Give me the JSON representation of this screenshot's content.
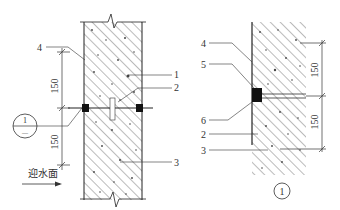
{
  "diagram": {
    "type": "construction detail – waterproof construction joint",
    "left_view": {
      "callouts": [
        {
          "id": "4",
          "label": "4"
        },
        {
          "id": "1",
          "label": "1"
        },
        {
          "id": "2",
          "label": "2"
        },
        {
          "id": "3",
          "label": "3"
        }
      ],
      "dimensions": [
        "150",
        "150"
      ],
      "section_marker": {
        "number": "1",
        "sheet": "—"
      },
      "water_side_label": "迎水面"
    },
    "right_view": {
      "callouts": [
        {
          "id": "4",
          "label": "4"
        },
        {
          "id": "5",
          "label": "5"
        },
        {
          "id": "6",
          "label": "6"
        },
        {
          "id": "2",
          "label": "2"
        },
        {
          "id": "3",
          "label": "3"
        }
      ],
      "dimensions": [
        "150",
        "150"
      ],
      "detail_marker": "1"
    }
  }
}
